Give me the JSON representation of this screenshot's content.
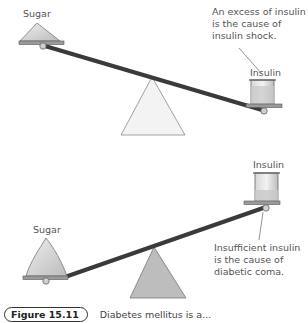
{
  "diagram": {
    "top_scale": {
      "left_label": "Sugar",
      "right_label": "Insulin",
      "annotation": "An excess of insulin is the cause of insulin shock."
    },
    "bottom_scale": {
      "left_label": "Sugar",
      "right_label": "Insulin",
      "annotation": "Insufficient insulin is the cause of diabetic coma."
    },
    "colors": {
      "beam": "#3a3a3a",
      "top_fulcrum": "#f2f2f2",
      "bottom_fulcrum": "#bdbdbd",
      "pan": "#8c8c8c",
      "sugar": "#d9d9d9",
      "beaker_liquid": "#c9c9c9"
    }
  },
  "caption": {
    "figure_number": "Figure 15.11",
    "text": "Diabetes mellitus is a..."
  }
}
